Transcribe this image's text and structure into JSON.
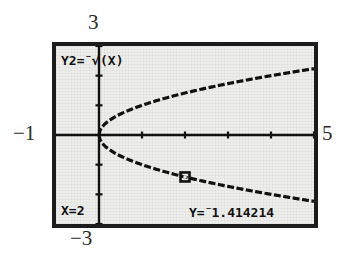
{
  "annotations": {
    "top_label": "3",
    "bottom_label": "−3",
    "left_label": "−1",
    "right_label": "5"
  },
  "calculator": {
    "function_label": "Y2=",
    "function_negative_sign": "⁻",
    "function_radical": "√",
    "function_argument": "(X)",
    "x_readout": "X=2",
    "y_readout_prefix": "Y=",
    "y_readout_negative_sign": "⁻",
    "y_readout_value": "1.414214",
    "cursor_icon": "trace-cursor"
  },
  "colors": {
    "screen_background": "#eeeeec",
    "screen_border": "#1c1c1c",
    "ink": "#111111",
    "page_background": "#ffffff",
    "annotation_text": "#2b2b2b"
  },
  "chart_data": {
    "type": "line",
    "title": "",
    "xlabel": "",
    "ylabel": "",
    "xlim": [
      -1,
      5
    ],
    "ylim": [
      -3,
      3
    ],
    "grid": false,
    "axes_ticks_x": [
      0,
      1,
      2,
      3,
      4,
      5
    ],
    "axes_ticks_y": [
      -3,
      -2,
      -1,
      0,
      1,
      2,
      3
    ],
    "xscl": 1,
    "yscl": 1,
    "legend": [],
    "series": [
      {
        "name": "Y1=√(X)",
        "expression": "sqrt(x)",
        "x": [
          0,
          0.25,
          0.5,
          0.75,
          1,
          1.5,
          2,
          2.5,
          3,
          3.5,
          4,
          4.5,
          5
        ],
        "values": [
          0,
          0.5,
          0.7071,
          0.866,
          1,
          1.2247,
          1.4142,
          1.5811,
          1.7321,
          1.8708,
          2,
          2.1213,
          2.2361
        ]
      },
      {
        "name": "Y2=⁻√(X)",
        "expression": "-sqrt(x)",
        "x": [
          0,
          0.25,
          0.5,
          0.75,
          1,
          1.5,
          2,
          2.5,
          3,
          3.5,
          4,
          4.5,
          5
        ],
        "values": [
          0,
          -0.5,
          -0.7071,
          -0.866,
          -1,
          -1.2247,
          -1.4142,
          -1.5811,
          -1.7321,
          -1.8708,
          -2,
          -2.1213,
          -2.2361
        ]
      }
    ],
    "trace_point": {
      "x": 2,
      "y": -1.414214,
      "series": "Y2=⁻√(X)"
    }
  }
}
